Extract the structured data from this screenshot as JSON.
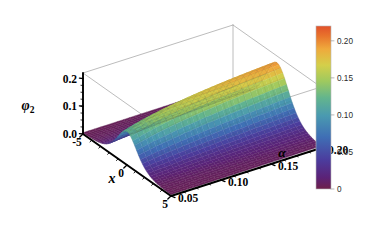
{
  "chart_data": {
    "type": "surface",
    "title": "",
    "xlabel": "x",
    "ylabel": "α",
    "zlabel": "φ₂",
    "x": [
      -5,
      -4,
      -3,
      -2,
      -1,
      0,
      1,
      2,
      3,
      4,
      5
    ],
    "y": [
      0.05,
      0.075,
      0.1,
      0.125,
      0.15,
      0.175,
      0.2
    ],
    "xlim": [
      -5,
      5
    ],
    "ylim": [
      0.05,
      0.2
    ],
    "zlim": [
      0.0,
      0.22
    ],
    "x_ticks": [
      "-5",
      "0",
      "5"
    ],
    "x_tick_values": [
      -5,
      0,
      5
    ],
    "y_ticks": [
      "0.05",
      "0.10",
      "0.15",
      "0.20"
    ],
    "y_tick_values": [
      0.05,
      0.1,
      0.15,
      0.2
    ],
    "z_ticks": [
      "0.0",
      "0.1",
      "0.2"
    ],
    "z_tick_values": [
      0.0,
      0.1,
      0.2
    ],
    "grid": true,
    "mesh": true,
    "box": true,
    "colormap": "rainbow",
    "colorbar": {
      "position": "right",
      "min": 0,
      "max": 0.22,
      "ticks": [
        "0.20",
        "0.15",
        "0.10",
        "0.05",
        "0"
      ],
      "tick_values": [
        0.2,
        0.15,
        0.1,
        0.05,
        0.0
      ],
      "stops": [
        {
          "t": 0.0,
          "color": "#6d1f4a"
        },
        {
          "t": 0.07,
          "color": "#5b2277"
        },
        {
          "t": 0.18,
          "color": "#4b3d9e"
        },
        {
          "t": 0.32,
          "color": "#3f6fb5"
        },
        {
          "t": 0.45,
          "color": "#4a9ab0"
        },
        {
          "t": 0.56,
          "color": "#63b58d"
        },
        {
          "t": 0.66,
          "color": "#9ec95f"
        },
        {
          "t": 0.76,
          "color": "#d4cf4a"
        },
        {
          "t": 0.86,
          "color": "#efa93c"
        },
        {
          "t": 0.94,
          "color": "#e8732c"
        },
        {
          "t": 1.0,
          "color": "#e2512a"
        }
      ]
    },
    "z_values": [
      [
        0.0032,
        0.0068,
        0.0155,
        0.035,
        0.07,
        0.093,
        0.07,
        0.035,
        0.0155,
        0.0068,
        0.0032
      ],
      [
        0.004,
        0.009,
        0.0205,
        0.047,
        0.096,
        0.129,
        0.096,
        0.047,
        0.0205,
        0.009,
        0.004
      ],
      [
        0.0048,
        0.011,
        0.0255,
        0.059,
        0.122,
        0.164,
        0.122,
        0.059,
        0.0255,
        0.011,
        0.0048
      ],
      [
        0.0055,
        0.0128,
        0.03,
        0.07,
        0.145,
        0.192,
        0.145,
        0.07,
        0.03,
        0.0128,
        0.0055
      ],
      [
        0.0062,
        0.0145,
        0.034,
        0.08,
        0.165,
        0.206,
        0.165,
        0.08,
        0.034,
        0.0145,
        0.0062
      ],
      [
        0.0068,
        0.0158,
        0.0372,
        0.0875,
        0.179,
        0.214,
        0.179,
        0.0875,
        0.0372,
        0.0158,
        0.0068
      ],
      [
        0.0072,
        0.0168,
        0.0395,
        0.093,
        0.188,
        0.218,
        0.188,
        0.093,
        0.0395,
        0.0168,
        0.0072
      ]
    ]
  },
  "axes": {
    "x_label": "x",
    "y_label": "α",
    "z_label": "φ",
    "z_label_sub": "2",
    "x_ticks": [
      "-5",
      "0",
      "5"
    ],
    "y_ticks": [
      "0.05",
      "0.10",
      "0.15",
      "0.20"
    ],
    "z_ticks": [
      "0.0",
      "0.1",
      "0.2"
    ]
  },
  "colorbar_labels": [
    "0.20",
    "0.15",
    "0.10",
    "0.05",
    "0"
  ]
}
